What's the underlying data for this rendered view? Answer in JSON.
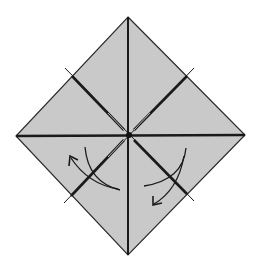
{
  "diagram": {
    "type": "origami-fold-diagram",
    "colors": {
      "paper_fill": "#c9c9c9",
      "line": "#1a1a1a",
      "background": "#ffffff"
    },
    "paper": {
      "top": [
        128,
        17
      ],
      "right": [
        245,
        135
      ],
      "bottom": [
        128,
        255
      ],
      "left": [
        16,
        136
      ],
      "center": [
        129,
        135
      ]
    },
    "creases": [
      {
        "name": "vertical",
        "from": [
          128,
          17
        ],
        "to": [
          128,
          255
        ]
      },
      {
        "name": "horizontal",
        "from": [
          16,
          136
        ],
        "to": [
          245,
          135
        ]
      },
      {
        "name": "diagonal-nw-se",
        "from": [
          65,
          68
        ],
        "to": [
          194,
          201
        ]
      },
      {
        "name": "diagonal-ne-sw",
        "from": [
          194,
          68
        ],
        "to": [
          64,
          203
        ]
      }
    ],
    "arrows": [
      {
        "name": "left-fold-arrow",
        "direction": "counter-clockwise up-left"
      },
      {
        "name": "right-fold-arrow",
        "direction": "clockwise down-left"
      }
    ]
  }
}
